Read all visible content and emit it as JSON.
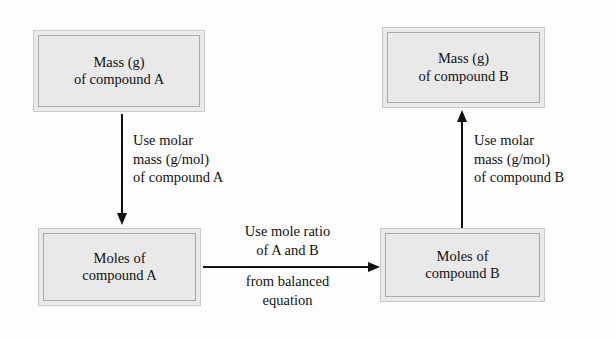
{
  "diagram": {
    "background_color": "#fefefe",
    "box_fill_color": "#e9e9e9",
    "box_border_color": "#a9a9a9",
    "arrow_color": "#111111",
    "nodes": [
      {
        "id": "mass-a",
        "line1": "Mass (g)",
        "line2": "of compound A"
      },
      {
        "id": "mass-b",
        "line1": "Mass (g)",
        "line2": "of compound B"
      },
      {
        "id": "moles-a",
        "line1": "Moles of",
        "line2": "compound A"
      },
      {
        "id": "moles-b",
        "line1": "Moles of",
        "line2": "compound B"
      }
    ],
    "edges": [
      {
        "id": "mass-a-to-moles-a",
        "direction": "down",
        "label_line1": "Use molar",
        "label_line2": "mass (g/mol)",
        "label_line3": "of compound A"
      },
      {
        "id": "moles-a-to-moles-b",
        "direction": "right",
        "label_above_line1": "Use mole ratio",
        "label_above_line2": "of A and B",
        "label_below_line1": "from balanced",
        "label_below_line2": "equation"
      },
      {
        "id": "moles-b-to-mass-b",
        "direction": "up",
        "label_line1": "Use molar",
        "label_line2": "mass (g/mol)",
        "label_line3": "of compound B"
      }
    ]
  }
}
